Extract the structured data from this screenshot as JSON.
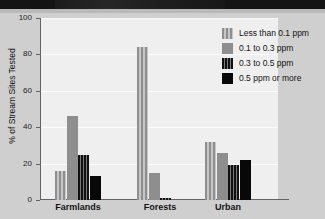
{
  "chart_data": {
    "type": "bar",
    "title": "",
    "xlabel": "",
    "ylabel": "% of Stream Sites Tested",
    "ylim": [
      0,
      100
    ],
    "yticks": [
      0,
      20,
      40,
      60,
      80,
      100
    ],
    "grid": true,
    "legend_position": "top-right",
    "categories": [
      "Farmlands",
      "Forests",
      "Urban"
    ],
    "series": [
      {
        "name": "Less than 0.1 ppm",
        "values": [
          16,
          84,
          32
        ],
        "swatch": "light-striped"
      },
      {
        "name": "0.1 to 0.3 ppm",
        "values": [
          46,
          15,
          26
        ],
        "swatch": "solid-gray"
      },
      {
        "name": "0.3 to 0.5 ppm",
        "values": [
          25,
          1,
          19
        ],
        "swatch": "dark-striped"
      },
      {
        "name": "0.5 ppm or more",
        "values": [
          13,
          0,
          22
        ],
        "swatch": "solid-black"
      }
    ]
  },
  "axis": {
    "y_tick_labels": [
      "0",
      "20",
      "40",
      "60",
      "80",
      "100"
    ],
    "y_title": "% of Stream Sites Tested"
  },
  "legend": {
    "entries": [
      {
        "label": "Less than 0.1 ppm"
      },
      {
        "label": "0.1 to 0.3 ppm"
      },
      {
        "label": "0.3 to 0.5 ppm"
      },
      {
        "label": "0.5 ppm or more"
      }
    ]
  },
  "colors": {
    "page_background": "#cfcfcf",
    "plot_background": "#efefef",
    "gridline": "#fbfbfb",
    "axis": "#636363",
    "bar_gray": "#8e8e8e",
    "bar_black": "#080808",
    "text": "#141414",
    "top_band": "#141414"
  }
}
